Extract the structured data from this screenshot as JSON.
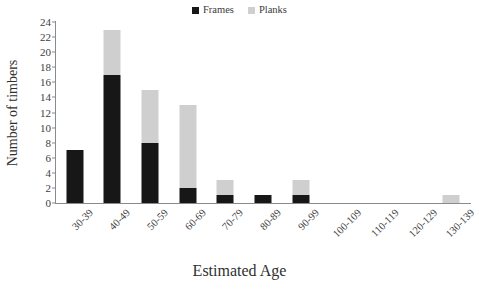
{
  "chart_data": {
    "type": "bar",
    "subtype": "stacked-vertical-bar",
    "title": "",
    "xlabel": "Estimated Age",
    "ylabel": "Number of timbers",
    "categories": [
      "30-39",
      "40-49",
      "50-59",
      "60-69",
      "70-79",
      "80-89",
      "90-99",
      "100-109",
      "110-119",
      "120-129",
      "130-139"
    ],
    "series": [
      {
        "name": "Frames",
        "color": "#171717",
        "values": [
          7,
          17,
          8,
          2,
          1,
          1,
          1,
          0,
          0,
          0,
          0
        ]
      },
      {
        "name": "Planks",
        "color": "#cfcfcf",
        "values": [
          0,
          6,
          7,
          11,
          2,
          0,
          2,
          0,
          0,
          0,
          1
        ]
      }
    ],
    "totals": [
      7,
      23,
      15,
      13,
      3,
      1,
      3,
      0,
      0,
      0,
      1
    ],
    "ylim": [
      0,
      24
    ],
    "ytick_step": 2,
    "yticks": [
      0,
      2,
      4,
      6,
      8,
      10,
      12,
      14,
      16,
      18,
      20,
      22,
      24
    ],
    "grid": false,
    "legend_position": "top-center",
    "xlabel_rotation": -45
  },
  "legend": {
    "items": [
      {
        "label": "Frames",
        "color": "#171717"
      },
      {
        "label": "Planks",
        "color": "#cfcfcf"
      }
    ]
  },
  "axes": {
    "y_title": "Number of timbers",
    "x_title": "Estimated Age"
  }
}
